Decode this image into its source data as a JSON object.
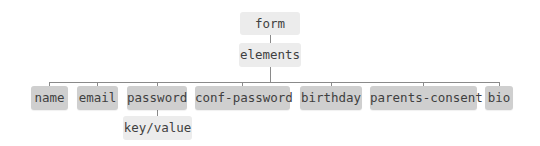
{
  "diagram": {
    "type": "tree",
    "root": {
      "label": "form",
      "children": [
        {
          "label": "elements",
          "children": [
            {
              "label": "name"
            },
            {
              "label": "email"
            },
            {
              "label": "password",
              "children": [
                {
                  "label": "key/value"
                }
              ]
            },
            {
              "label": "conf-password"
            },
            {
              "label": "birthday"
            },
            {
              "label": "parents-consent"
            },
            {
              "label": "bio"
            }
          ]
        }
      ]
    },
    "nodes": {
      "form": "form",
      "elements": "elements",
      "name": "name",
      "email": "email",
      "password": "password",
      "conf_password": "conf-password",
      "birthday": "birthday",
      "parents_consent": "parents-consent",
      "bio": "bio",
      "key_value": "key/value"
    },
    "colors": {
      "container_node": "#ececec",
      "leaf_node": "#cfcfcf",
      "text": "#3f3f3f",
      "connector": "#8a8a8a"
    }
  }
}
